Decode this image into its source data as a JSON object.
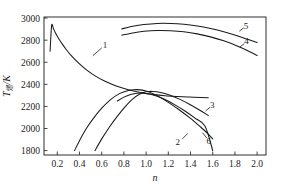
{
  "chart_data": {
    "type": "line",
    "title": "",
    "subtitle": "",
    "xlabel": "n",
    "ylabel": "T燃/K",
    "ylabel_base": "T",
    "ylabel_sub": "燃",
    "ylabel_unit": "/K",
    "xlim": [
      0.08,
      2.08
    ],
    "ylim": [
      1760,
      3010
    ],
    "grid": false,
    "legend_position": "inline-curve-labels",
    "xticks": [
      0.2,
      0.4,
      0.6,
      0.8,
      1.0,
      1.2,
      1.4,
      1.6,
      1.8,
      2.0
    ],
    "xtick_labels": [
      "0.2",
      "0.4",
      "0.6",
      "0.8",
      "1.0",
      "1.2",
      "1.4",
      "1.6",
      "1.8",
      "2.0"
    ],
    "yticks": [
      1800,
      2000,
      2200,
      2400,
      2600,
      2800,
      3000
    ],
    "ytick_labels": [
      "1800",
      "2000",
      "2200",
      "2400",
      "2600",
      "2800",
      "3000"
    ],
    "series": [
      {
        "name": "1",
        "label": "1",
        "label_x": 0.63,
        "label_y": 2760,
        "leader_from": [
          0.6,
          2730
        ],
        "leader_to": [
          0.52,
          2660
        ],
        "x": [
          0.135,
          0.14,
          0.15,
          0.165,
          0.185,
          0.21,
          0.24,
          0.28,
          0.33,
          0.39,
          0.46,
          0.54,
          0.63,
          0.73,
          0.84,
          0.95,
          1.06,
          1.17,
          1.28,
          1.39,
          1.5,
          1.56
        ],
        "y": [
          2700,
          2800,
          2940,
          2905,
          2862,
          2818,
          2772,
          2716,
          2655,
          2594,
          2533,
          2477,
          2428,
          2386,
          2352,
          2326,
          2309,
          2297,
          2290,
          2285,
          2281,
          2279
        ]
      },
      {
        "name": "2",
        "label": "2",
        "label_x": 1.285,
        "label_y": 1882,
        "leader_from": [
          1.325,
          1905
        ],
        "leader_to": [
          1.375,
          1955
        ],
        "x": [
          0.355,
          0.4,
          0.46,
          0.53,
          0.6,
          0.68,
          0.76,
          0.84,
          0.9,
          0.95,
          1.0,
          1.06,
          1.13,
          1.21,
          1.3,
          1.4,
          1.49,
          1.56,
          1.6
        ],
        "y": [
          1800,
          1890,
          1998,
          2098,
          2184,
          2262,
          2316,
          2345,
          2352,
          2350,
          2339,
          2316,
          2280,
          2230,
          2168,
          2092,
          2014,
          1950,
          1905
        ]
      },
      {
        "name": "3",
        "label": "3",
        "label_x": 1.595,
        "label_y": 2212,
        "leader_from": [
          1.575,
          2192
        ],
        "leader_to": [
          1.535,
          2158
        ],
        "x": [
          0.54,
          0.6,
          0.67,
          0.74,
          0.81,
          0.88,
          0.94,
          1.0,
          1.06,
          1.13,
          1.21,
          1.3,
          1.39,
          1.48,
          1.56
        ],
        "y": [
          1800,
          1906,
          2014,
          2110,
          2196,
          2268,
          2310,
          2332,
          2336,
          2327,
          2303,
          2266,
          2220,
          2168,
          2118
        ]
      },
      {
        "name": "4",
        "label": "4",
        "label_x": 1.905,
        "label_y": 2790,
        "leader_from": [
          1.885,
          2770
        ],
        "leader_to": [
          1.845,
          2738
        ],
        "x": [
          0.78,
          0.88,
          0.98,
          1.1,
          1.22,
          1.34,
          1.46,
          1.58,
          1.7,
          1.82,
          1.92,
          2.0
        ],
        "y": [
          2845,
          2866,
          2880,
          2888,
          2886,
          2876,
          2857,
          2830,
          2794,
          2748,
          2702,
          2662
        ]
      },
      {
        "name": "5",
        "label": "5",
        "label_x": 1.9,
        "label_y": 2930,
        "leader_from": [
          1.88,
          2912
        ],
        "leader_to": [
          1.84,
          2882
        ],
        "x": [
          0.78,
          0.88,
          0.98,
          1.1,
          1.22,
          1.34,
          1.46,
          1.58,
          1.7,
          1.82,
          1.92,
          2.0
        ],
        "y": [
          2902,
          2926,
          2942,
          2952,
          2952,
          2944,
          2928,
          2905,
          2876,
          2840,
          2806,
          2778
        ]
      },
      {
        "name": "6",
        "label": "6",
        "label_x": 1.565,
        "label_y": 1890,
        "leader_from": [
          1.548,
          1912
        ],
        "leader_to": [
          1.508,
          1962
        ],
        "x": [
          0.74,
          0.8,
          0.86,
          0.92,
          0.98,
          1.04,
          1.1,
          1.18,
          1.26,
          1.35,
          1.44,
          1.53,
          1.6
        ],
        "y": [
          2248,
          2284,
          2308,
          2320,
          2320,
          2310,
          2292,
          2258,
          2214,
          2158,
          2094,
          2022,
          1800
        ]
      }
    ]
  },
  "axes": {
    "x_axis_name": "n",
    "y_axis_name": "T燃/K"
  }
}
